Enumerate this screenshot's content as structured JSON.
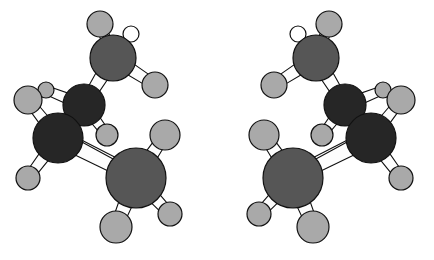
{
  "figure": {
    "description": "Two enantiomeric ball-and-stick molecular models shown side by side as non-superimposable mirror images",
    "background_color": "#ffffff",
    "width": 434,
    "height": 260
  },
  "palette": {
    "carbon_dark": "#262626",
    "carbon_medium": "#565656",
    "hydrogen_light": "#a9a9a9",
    "bond_fill": "#fdfdfd",
    "outline": "#111111",
    "background": "#ffffff"
  },
  "legend": {
    "carbon_dark_label": "inner carbon",
    "carbon_medium_label": "terminal methyl carbon",
    "hydrogen_label": "hydrogen"
  },
  "molecules": [
    {
      "name": "molecule-left",
      "handedness": "left",
      "atoms": [
        {
          "id": "L-C1",
          "element": "C",
          "shade": "carbon_medium",
          "cx": 113,
          "cy": 58,
          "r": 23
        },
        {
          "id": "L-C2",
          "element": "C",
          "shade": "carbon_dark",
          "cx": 84,
          "cy": 105,
          "r": 21
        },
        {
          "id": "L-C3",
          "element": "C",
          "shade": "carbon_dark",
          "cx": 58,
          "cy": 138,
          "r": 25
        },
        {
          "id": "L-C4",
          "element": "C",
          "shade": "carbon_medium",
          "cx": 136,
          "cy": 178,
          "r": 30
        },
        {
          "id": "L-H1",
          "element": "H",
          "shade": "hydrogen_light",
          "cx": 100,
          "cy": 24,
          "r": 13
        },
        {
          "id": "L-H2",
          "element": "H",
          "shade": "hydrogen_light",
          "cx": 155,
          "cy": 85,
          "r": 13
        },
        {
          "id": "L-H3",
          "element": "H",
          "shade": "hidden",
          "cx": 131,
          "cy": 34,
          "r": 8
        },
        {
          "id": "L-H4",
          "element": "H",
          "shade": "hydrogen_light",
          "cx": 46,
          "cy": 90,
          "r": 8
        },
        {
          "id": "L-H5",
          "element": "H",
          "shade": "hydrogen_light",
          "cx": 28,
          "cy": 100,
          "r": 14
        },
        {
          "id": "L-H6",
          "element": "H",
          "shade": "hydrogen_light",
          "cx": 107,
          "cy": 135,
          "r": 11
        },
        {
          "id": "L-H7",
          "element": "H",
          "shade": "hydrogen_light",
          "cx": 28,
          "cy": 178,
          "r": 12
        },
        {
          "id": "L-H8",
          "element": "H",
          "shade": "hydrogen_light",
          "cx": 165,
          "cy": 135,
          "r": 15
        },
        {
          "id": "L-H9",
          "element": "H",
          "shade": "hydrogen_light",
          "cx": 116,
          "cy": 227,
          "r": 16
        },
        {
          "id": "L-H10",
          "element": "H",
          "shade": "hydrogen_light",
          "cx": 170,
          "cy": 214,
          "r": 12
        }
      ],
      "bonds": [
        {
          "from": "L-C1",
          "to": "L-H1",
          "width": 5.5,
          "type": "stick"
        },
        {
          "from": "L-C1",
          "to": "L-H2",
          "width": 6.5,
          "type": "stick"
        },
        {
          "from": "L-C1",
          "to": "L-C2",
          "width": 7.0,
          "type": "stick"
        },
        {
          "from": "L-C2",
          "to": "L-H4",
          "width": 5.5,
          "type": "stick"
        },
        {
          "from": "L-C2",
          "to": "L-H6",
          "width": 5.5,
          "type": "stick"
        },
        {
          "from": "L-C2",
          "to": "L-C3",
          "width": 6.5,
          "type": "stick"
        },
        {
          "from": "L-C3",
          "to": "L-H5",
          "width": 6.0,
          "type": "stick"
        },
        {
          "from": "L-C3",
          "to": "L-H7",
          "width": 6.0,
          "type": "stick"
        },
        {
          "from": "L-C3",
          "to": "L-C4",
          "width": 7.5,
          "type": "stick"
        },
        {
          "from": "L-C4",
          "to": "L-H8",
          "width": 7.0,
          "type": "stick"
        },
        {
          "from": "L-C4",
          "to": "L-H9",
          "width": 7.5,
          "type": "stick"
        },
        {
          "from": "L-C4",
          "to": "L-H10",
          "width": 6.5,
          "type": "stick"
        },
        {
          "from": "L-C3",
          "to": "L-C4",
          "width": 0,
          "type": "thin",
          "offset": -9
        }
      ]
    },
    {
      "name": "molecule-right",
      "handedness": "right",
      "atoms": [
        {
          "id": "R-C1",
          "element": "C",
          "shade": "carbon_medium",
          "cx": 316,
          "cy": 58,
          "r": 23
        },
        {
          "id": "R-C2",
          "element": "C",
          "shade": "carbon_dark",
          "cx": 345,
          "cy": 105,
          "r": 21
        },
        {
          "id": "R-C3",
          "element": "C",
          "shade": "carbon_dark",
          "cx": 371,
          "cy": 138,
          "r": 25
        },
        {
          "id": "R-C4",
          "element": "C",
          "shade": "carbon_medium",
          "cx": 293,
          "cy": 178,
          "r": 30
        },
        {
          "id": "R-H1",
          "element": "H",
          "shade": "hydrogen_light",
          "cx": 329,
          "cy": 24,
          "r": 13
        },
        {
          "id": "R-H2",
          "element": "H",
          "shade": "hydrogen_light",
          "cx": 274,
          "cy": 85,
          "r": 13
        },
        {
          "id": "R-H3",
          "element": "H",
          "shade": "hidden",
          "cx": 298,
          "cy": 34,
          "r": 8
        },
        {
          "id": "R-H4",
          "element": "H",
          "shade": "hydrogen_light",
          "cx": 383,
          "cy": 90,
          "r": 8
        },
        {
          "id": "R-H5",
          "element": "H",
          "shade": "hydrogen_light",
          "cx": 401,
          "cy": 100,
          "r": 14
        },
        {
          "id": "R-H6",
          "element": "H",
          "shade": "hydrogen_light",
          "cx": 322,
          "cy": 135,
          "r": 11
        },
        {
          "id": "R-H7",
          "element": "H",
          "shade": "hydrogen_light",
          "cx": 401,
          "cy": 178,
          "r": 12
        },
        {
          "id": "R-H8",
          "element": "H",
          "shade": "hydrogen_light",
          "cx": 264,
          "cy": 135,
          "r": 15
        },
        {
          "id": "R-H9",
          "element": "H",
          "shade": "hydrogen_light",
          "cx": 313,
          "cy": 227,
          "r": 16
        },
        {
          "id": "R-H10",
          "element": "H",
          "shade": "hydrogen_light",
          "cx": 259,
          "cy": 214,
          "r": 12
        }
      ],
      "bonds": [
        {
          "from": "R-C1",
          "to": "R-H1",
          "width": 5.5,
          "type": "stick"
        },
        {
          "from": "R-C1",
          "to": "R-H2",
          "width": 6.5,
          "type": "stick"
        },
        {
          "from": "R-C1",
          "to": "R-C2",
          "width": 7.0,
          "type": "stick"
        },
        {
          "from": "R-C2",
          "to": "R-H4",
          "width": 5.5,
          "type": "stick"
        },
        {
          "from": "R-C2",
          "to": "R-H6",
          "width": 5.5,
          "type": "stick"
        },
        {
          "from": "R-C2",
          "to": "R-C3",
          "width": 6.5,
          "type": "stick"
        },
        {
          "from": "R-C3",
          "to": "R-H5",
          "width": 6.0,
          "type": "stick"
        },
        {
          "from": "R-C3",
          "to": "R-H7",
          "width": 6.0,
          "type": "stick"
        },
        {
          "from": "R-C3",
          "to": "R-C4",
          "width": 7.5,
          "type": "stick"
        },
        {
          "from": "R-C4",
          "to": "R-H8",
          "width": 7.0,
          "type": "stick"
        },
        {
          "from": "R-C4",
          "to": "R-H9",
          "width": 7.5,
          "type": "stick"
        },
        {
          "from": "R-C4",
          "to": "R-H10",
          "width": 6.5,
          "type": "stick"
        },
        {
          "from": "R-C3",
          "to": "R-C4",
          "width": 0,
          "type": "thin",
          "offset": 9
        }
      ]
    }
  ],
  "draw_order": {
    "molecule-left": [
      "L-H1",
      "L-H3",
      "bond:L-C1-L-H1",
      "bond:L-C1-L-H2",
      "L-H2",
      "bond:L-C1-L-C2",
      "L-C1",
      "L-H5",
      "L-H4",
      "bond:L-C2-L-H4",
      "bond:L-C1-L-C2b",
      "L-C2",
      "bond:L-C2-L-H6",
      "L-H6",
      "bond:L-C2-L-C3",
      "bond:L-C3-L-H5",
      "bond:L-C3-L-H7",
      "L-H7",
      "L-C3",
      "thin:L-C3-L-C4",
      "bond:L-C3-L-C4",
      "L-H8",
      "bond:L-C4-L-H8",
      "L-C4",
      "bond:L-C4-L-H9",
      "bond:L-C4-L-H10",
      "L-H9",
      "L-H10"
    ],
    "molecule-right": [
      "R-H1",
      "R-H3",
      "bond:R-C1-R-H1",
      "bond:R-C1-R-H2",
      "R-H2",
      "bond:R-C1-R-C2",
      "R-C1",
      "R-H5",
      "R-H4",
      "bond:R-C2-R-H4",
      "R-C2",
      "bond:R-C2-R-H6",
      "R-H6",
      "bond:R-C2-R-C3",
      "bond:R-C3-R-H5",
      "bond:R-C3-R-H7",
      "R-H7",
      "R-C3",
      "thin:R-C3-R-C4",
      "bond:R-C3-R-C4",
      "R-H8",
      "bond:R-C4-R-H8",
      "R-C4",
      "bond:R-C4-R-H9",
      "bond:R-C4-R-H10",
      "R-H9",
      "R-H10"
    ]
  }
}
